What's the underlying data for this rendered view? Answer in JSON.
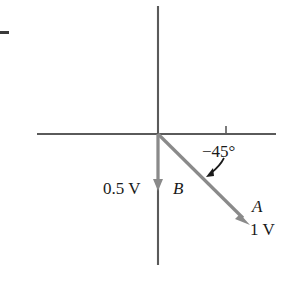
{
  "figure": {
    "type": "phasor-diagram",
    "background_color": "#ffffff",
    "axis_color": "#5a5a5a",
    "vector_color": "#8a8a8a",
    "text_color": "#1a1a1a",
    "annotation_arrow_color": "#1a1a1a"
  },
  "axes": {
    "origin": {
      "x": 158,
      "y": 134
    },
    "horizontal": {
      "x1": 37,
      "y1": 134,
      "x2": 276,
      "y2": 134
    },
    "vertical": {
      "x1": 158,
      "y1": 6,
      "x2": 158,
      "y2": 265
    },
    "tick": {
      "x": 226,
      "y_top": 126,
      "y_bottom": 134
    }
  },
  "vectors": [
    {
      "name": "A",
      "label": "A",
      "magnitude_label": "1 V",
      "angle_label": "−45°",
      "angle_degrees": -45,
      "from": {
        "x": 158,
        "y": 134
      },
      "to": {
        "x": 250,
        "y": 225
      }
    },
    {
      "name": "B",
      "label": "B",
      "magnitude_label": "0.5 V",
      "angle_degrees": -90,
      "from": {
        "x": 158,
        "y": 134
      },
      "to": {
        "x": 158,
        "y": 191
      }
    }
  ],
  "annotations": {
    "angle_callout": {
      "label": "−45°",
      "arrow_from": {
        "x": 223,
        "y": 159
      },
      "arrow_to": {
        "x": 206,
        "y": 177
      }
    },
    "edge_dash": {
      "x": 0,
      "y": 31,
      "width": 9,
      "height": 3
    }
  },
  "labels": {
    "magnitude_b": "0.5 V",
    "vector_b": "B",
    "angle": "−45°",
    "vector_a": "A",
    "magnitude_a": "1 V"
  }
}
